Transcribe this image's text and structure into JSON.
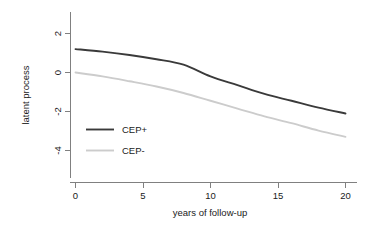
{
  "chart_data": {
    "type": "line",
    "title": "",
    "subtitle": "",
    "xlabel": "years of follow-up",
    "ylabel": "latent process",
    "xlim": [
      0,
      20
    ],
    "ylim": [
      -5,
      2.6
    ],
    "xticks": [
      0,
      5,
      10,
      15,
      20
    ],
    "xticklabels": [
      "0",
      "5",
      "10",
      "15",
      "20"
    ],
    "yticks": [
      2,
      0,
      -2,
      -4
    ],
    "yticklabels": [
      "2",
      "0",
      "-2",
      "-4"
    ],
    "grid": false,
    "legend_position": "inside-left",
    "x": [
      0,
      2,
      4,
      6,
      8,
      10,
      12,
      14,
      16,
      18,
      20
    ],
    "series": [
      {
        "name": "CEP+",
        "color": "#3a3a3a",
        "linewidth": 1.9,
        "values": [
          1.2,
          1.07,
          0.9,
          0.68,
          0.4,
          -0.2,
          -0.65,
          -1.1,
          -1.45,
          -1.8,
          -2.1
        ]
      },
      {
        "name": "CEP-",
        "color": "#cccccc",
        "linewidth": 1.9,
        "values": [
          0.0,
          -0.2,
          -0.45,
          -0.72,
          -1.05,
          -1.45,
          -1.85,
          -2.25,
          -2.6,
          -2.98,
          -3.3
        ]
      }
    ]
  },
  "axes": {
    "x_axis_label": "years of follow-up",
    "y_axis_label": "latent process"
  },
  "legend": {
    "entries": [
      {
        "label": "CEP+",
        "color": "#3a3a3a"
      },
      {
        "label": "CEP-",
        "color": "#cccccc"
      }
    ]
  },
  "colors": {
    "axis": "#808080",
    "text": "#1a1a1a",
    "background": "#ffffff",
    "series_dark": "#3a3a3a",
    "series_light": "#cccccc"
  }
}
